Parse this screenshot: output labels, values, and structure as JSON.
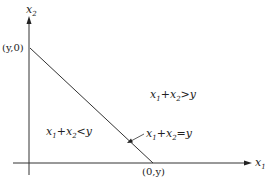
{
  "diagram": {
    "axes": {
      "x_label": "x",
      "x_sub": "1",
      "y_label": "x",
      "y_sub": "2"
    },
    "points": {
      "y_intercept": "(y,0)",
      "x_intercept": "(0,y)"
    },
    "regions": {
      "above": {
        "a": "x",
        "a_sub": "1",
        "op": "+",
        "b": "x",
        "b_sub": "2",
        "rel": ">y"
      },
      "below": {
        "a": "x",
        "a_sub": "1",
        "op": "+",
        "b": "x",
        "b_sub": "2",
        "rel": "<y"
      },
      "line": {
        "a": "x",
        "a_sub": "1",
        "op": "+",
        "b": "x",
        "b_sub": "2",
        "rel": "=y"
      }
    },
    "colors": {
      "line": "#333333",
      "text": "#222222"
    }
  }
}
